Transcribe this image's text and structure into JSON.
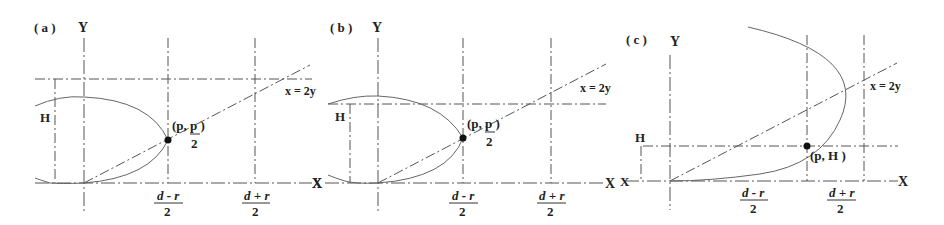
{
  "figure": {
    "panels": [
      {
        "id": "a",
        "label": "( a )",
        "y_axis_label": "Y",
        "x_axis_label": "X",
        "height_label": "H",
        "line_label": "x = 2y",
        "point_label_main": "(p, p )",
        "point_label_denominator": "2",
        "tick_left_num": "d - r",
        "tick_left_den": "2",
        "tick_right_num": "d + r",
        "tick_right_den": "2"
      },
      {
        "id": "b",
        "label": "( b )",
        "y_axis_label": "Y",
        "x_axis_label": "X",
        "x_axis_label_left": "X",
        "height_label": "H",
        "line_label": "x = 2y",
        "point_label_main": "(p, p )",
        "point_label_denominator": "2",
        "tick_left_num": "d - r",
        "tick_left_den": "2",
        "tick_right_num": "d + r",
        "tick_right_den": "2"
      },
      {
        "id": "c",
        "label": "( c )",
        "y_axis_label": "Y",
        "x_axis_label": "X",
        "x_axis_label_left": "X",
        "height_label": "H",
        "line_label": "x = 2y",
        "point_label_main": "(p, H )",
        "tick_left_num": "d - r",
        "tick_left_den": "2",
        "tick_right_num": "d + r",
        "tick_right_den": "2"
      }
    ]
  }
}
